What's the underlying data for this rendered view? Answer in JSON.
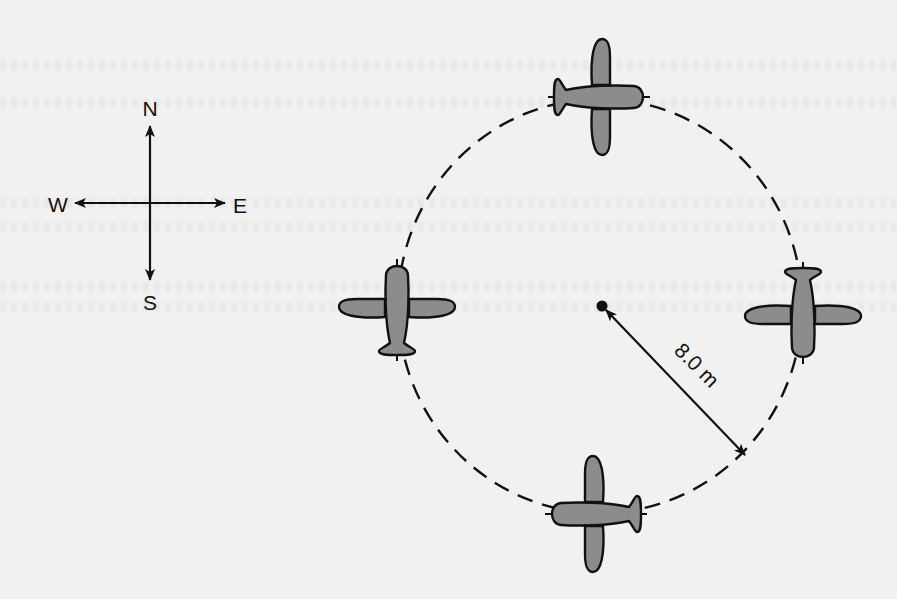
{
  "figure": {
    "type": "physics-diagram"
  },
  "compass": {
    "north": "N",
    "south": "S",
    "east": "E",
    "west": "W",
    "center": [
      150,
      203
    ]
  },
  "circle": {
    "center": [
      600,
      306
    ],
    "radius_px": 203,
    "style": "dashed",
    "radius_label": "8.0 m"
  },
  "planes": [
    {
      "position": "top",
      "heading": "east",
      "x": 598,
      "y": 97
    },
    {
      "position": "left",
      "heading": "north",
      "x": 397,
      "y": 305
    },
    {
      "position": "right",
      "heading": "south",
      "x": 803,
      "y": 312
    },
    {
      "position": "bottom",
      "heading": "west",
      "x": 597,
      "y": 514
    }
  ],
  "colors": {
    "background": "#f1f1ef",
    "plane_fill": "#8c8c8c",
    "outline": "#111111"
  }
}
